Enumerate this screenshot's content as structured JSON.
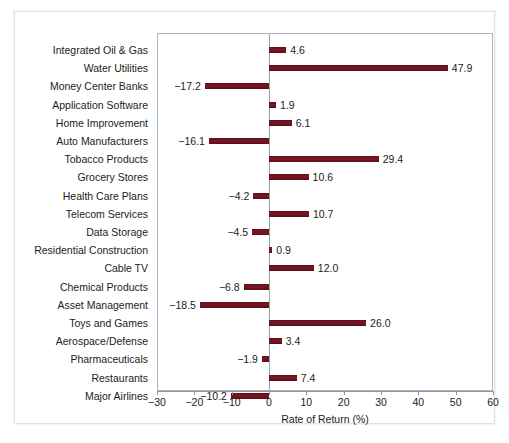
{
  "chart_data": {
    "type": "bar",
    "orientation": "horizontal",
    "title": "",
    "xlabel": "Rate of Return (%)",
    "ylabel": "",
    "xlim": [
      -30,
      60
    ],
    "xticks": [
      -30,
      -20,
      -10,
      0,
      10,
      20,
      30,
      40,
      50,
      60
    ],
    "xtick_labels": [
      "−30",
      "−20",
      "−10",
      "0",
      "10",
      "20",
      "30",
      "40",
      "50",
      "60"
    ],
    "grid": false,
    "legend": "none",
    "bar_color": "#6e1420",
    "zero_line": true,
    "categories": [
      "Integrated Oil & Gas",
      "Water Utilities",
      "Money Center Banks",
      "Application Software",
      "Home Improvement",
      "Auto Manufacturers",
      "Tobacco Products",
      "Grocery Stores",
      "Health Care Plans",
      "Telecom Services",
      "Data Storage",
      "Residential Construction",
      "Cable TV",
      "Chemical Products",
      "Asset Management",
      "Toys and Games",
      "Aerospace/Defense",
      "Pharmaceuticals",
      "Restaurants",
      "Major Airlines"
    ],
    "values": [
      4.6,
      47.9,
      -17.2,
      1.9,
      6.1,
      -16.1,
      29.4,
      10.6,
      -4.2,
      10.7,
      -4.5,
      0.9,
      12.0,
      -6.8,
      -18.5,
      26.0,
      3.4,
      -1.9,
      7.4,
      -10.2
    ],
    "value_labels": [
      "4.6",
      "47.9",
      "−17.2",
      "1.9",
      "6.1",
      "−16.1",
      "29.4",
      "10.6",
      "−4.2",
      "10.7",
      "−4.5",
      "0.9",
      "12.0",
      "−6.8",
      "−18.5",
      "26.0",
      "3.4",
      "−1.9",
      "7.4",
      "−10.2"
    ]
  }
}
